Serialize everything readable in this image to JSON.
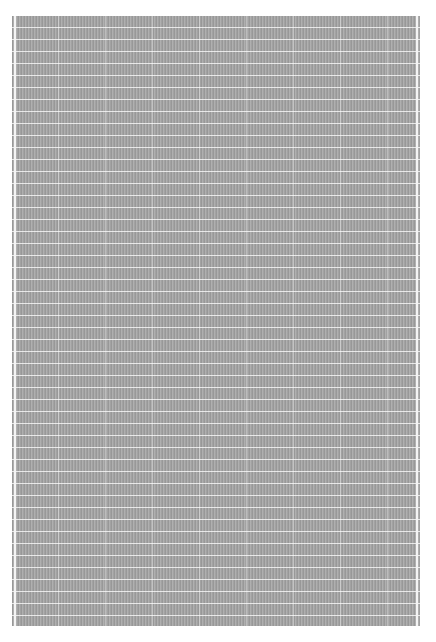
{
  "image": {
    "subject": "gray textured grid swatch",
    "colors": {
      "background": "#ffffff",
      "swatch": "#a9a9a9",
      "grid_lines": "#ffffff"
    }
  }
}
